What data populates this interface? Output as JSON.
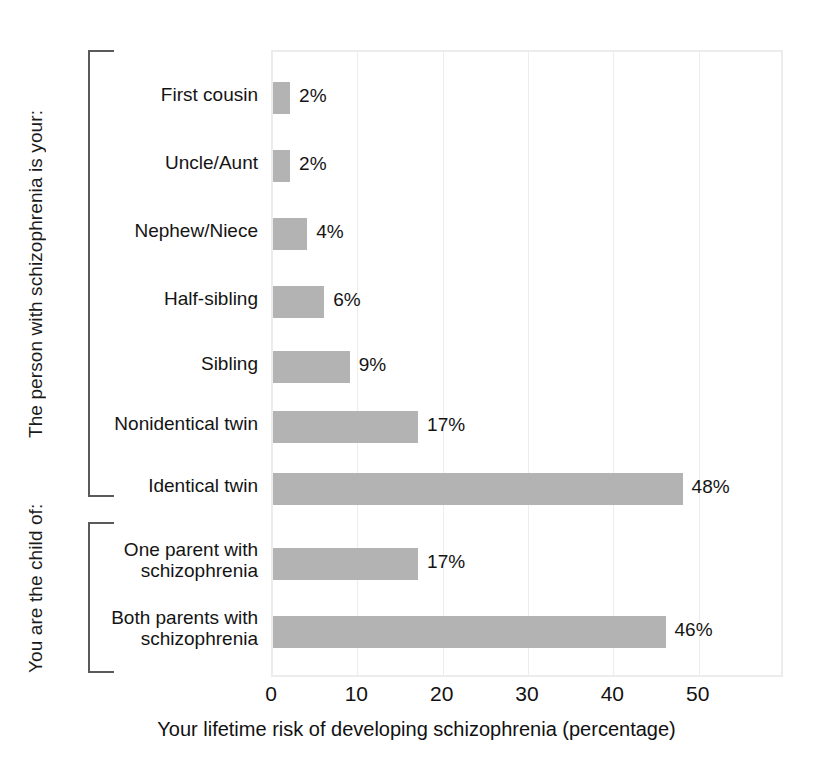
{
  "chart_data": {
    "type": "bar",
    "orientation": "horizontal",
    "title": "",
    "xlabel": "Your lifetime risk of developing schizophrenia (percentage)",
    "ylabel": "",
    "xlim": [
      0,
      60
    ],
    "xticks": [
      "0",
      "10",
      "20",
      "30",
      "40",
      "50"
    ],
    "xtick_values": [
      0,
      10,
      20,
      30,
      40,
      50
    ],
    "grid": "vertical",
    "legend": "none",
    "bar_color": "#b3b3b3",
    "categories": [
      "First cousin",
      "Uncle/Aunt",
      "Nephew/Niece",
      "Half-sibling",
      "Sibling",
      "Nonidentical twin",
      "Identical twin",
      "One parent with\nschizophrenia",
      "Both parents with\nschizophrenia"
    ],
    "values": [
      2,
      2,
      4,
      6,
      9,
      17,
      48,
      17,
      46
    ],
    "value_labels": [
      "2%",
      "2%",
      "4%",
      "6%",
      "9%",
      "17%",
      "48%",
      "17%",
      "46%"
    ],
    "groups": [
      {
        "label": "The person with schizophrenia is your:",
        "categories": [
          "First cousin",
          "Uncle/Aunt",
          "Nephew/Niece",
          "Half-sibling",
          "Sibling",
          "Nonidentical twin",
          "Identical twin"
        ]
      },
      {
        "label": "You are the child of:",
        "categories": [
          "One parent with schizophrenia",
          "Both parents with schizophrenia"
        ]
      }
    ]
  },
  "axis": {
    "x_title": "Your lifetime risk of developing schizophrenia (percentage)"
  },
  "groups": {
    "group1_label": "The person with schizophrenia is your:",
    "group2_label": "You are the child of:"
  },
  "rows": [
    {
      "label": "First cousin",
      "value_label": "2%"
    },
    {
      "label": "Uncle/Aunt",
      "value_label": "2%"
    },
    {
      "label": "Nephew/Niece",
      "value_label": "4%"
    },
    {
      "label": "Half-sibling",
      "value_label": "6%"
    },
    {
      "label": "Sibling",
      "value_label": "9%"
    },
    {
      "label": "Nonidentical twin",
      "value_label": "17%"
    },
    {
      "label": "Identical twin",
      "value_label": "48%"
    },
    {
      "label": "One parent with\nschizophrenia",
      "value_label": "17%"
    },
    {
      "label": "Both parents with\nschizophrenia",
      "value_label": "46%"
    }
  ],
  "xticks": [
    {
      "label": "0"
    },
    {
      "label": "10"
    },
    {
      "label": "20"
    },
    {
      "label": "30"
    },
    {
      "label": "40"
    },
    {
      "label": "50"
    }
  ]
}
